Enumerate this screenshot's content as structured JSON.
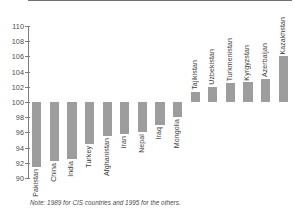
{
  "chart_data": {
    "type": "bar",
    "title": "",
    "subtitle": "",
    "xlabel": "",
    "ylabel": "",
    "ylim": [
      90,
      110
    ],
    "ytick_step": 2,
    "yticks": [
      110,
      108,
      106,
      104,
      102,
      100,
      98,
      96,
      94,
      92,
      90
    ],
    "baseline": 100,
    "grid": false,
    "legend": null,
    "bar_color": "#9d9d9d",
    "axis_color": "#7d7d7d",
    "categories": [
      "Pakistan",
      "China",
      "India",
      "Turkey",
      "Afghanistan",
      "Iran",
      "Nepal",
      "Iraq",
      "Mongolia",
      "Tajikistan",
      "Uzbekistan",
      "Turkmenistan",
      "Kyrgyzstan",
      "Azerbaijan",
      "Kazakhstan"
    ],
    "values": [
      91.5,
      92.2,
      92.5,
      94.5,
      95.5,
      95.8,
      96.0,
      97.0,
      98.0,
      101.3,
      102.0,
      102.5,
      102.6,
      103.0,
      106.0
    ],
    "note": "Note: 1989 for CIS countries and 1995 for the others."
  }
}
